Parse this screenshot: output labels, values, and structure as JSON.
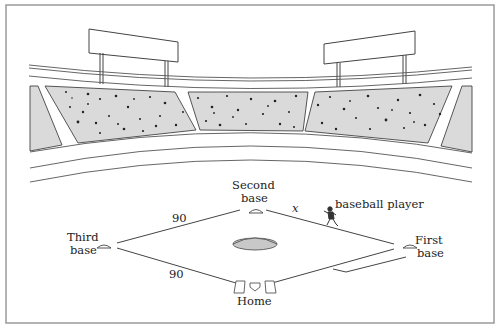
{
  "diagram": {
    "labels": {
      "second_base": [
        "Second",
        "base"
      ],
      "third_base": [
        "Third",
        "base"
      ],
      "first_base": [
        "First",
        "base"
      ],
      "home": "Home",
      "player": "baseball player",
      "variable": "x",
      "side_upper_left": "90",
      "side_lower_left": "90"
    },
    "colors": {
      "line": "#444444",
      "stand_fill": "#d9d9d9",
      "crowd_dot": "#222222",
      "mound_fill": "#c8c8c8",
      "border": "#9a9a9a",
      "background": "#ffffff"
    }
  }
}
